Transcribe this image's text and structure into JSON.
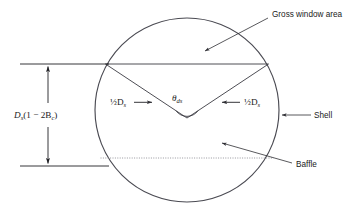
{
  "figure": {
    "labels": {
      "gross_window_area": "Gross window area",
      "shell": "Shell",
      "baffle": "Baffle",
      "half_ds_left": "½D",
      "half_ds_left_sub": "s",
      "half_ds_right": "½D",
      "half_ds_right_sub": "s",
      "theta": "θ",
      "theta_sub": "ds",
      "dimension_main": "D",
      "dimension_main_sub": "s",
      "dimension_rest": "(1 − 2B",
      "dimension_rest_sub": "c",
      "dimension_close": ")",
      "arrow_right": "→",
      "arrow_left": "←"
    },
    "colors": {
      "line": "#3a3a42",
      "shell_line": "#4a4a52",
      "dotted_line": "#8a8a92",
      "text": "#1a1a1a",
      "background": "#ffffff"
    },
    "geometry": {
      "circle_center_x": 187,
      "circle_center_y": 110,
      "circle_radius": 92,
      "chord_top_y": 64,
      "chord_bottom_y": 158,
      "vertex_x": 187,
      "vertex_y": 118
    }
  }
}
